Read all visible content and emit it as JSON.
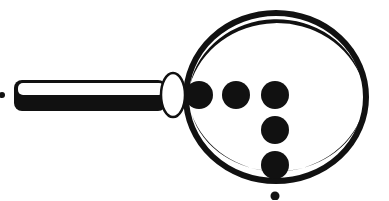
{
  "figure": {
    "colors": {
      "ink": "#111111",
      "paper": "#ffffff"
    },
    "lens": {
      "cx": 275,
      "cy": 97,
      "rx": 92,
      "ry": 85,
      "stroke_width": 7
    },
    "handle": {
      "x": 14,
      "y": 80,
      "width": 150,
      "height": 31
    },
    "ferrule": {
      "cx": 173,
      "cy": 95,
      "rx": 13,
      "ry": 22
    },
    "dots": [
      {
        "cx": 199,
        "cy": 95,
        "r": 14
      },
      {
        "cx": 236,
        "cy": 95,
        "r": 14
      },
      {
        "cx": 275,
        "cy": 95,
        "r": 14
      },
      {
        "cx": 275,
        "cy": 130,
        "r": 14
      },
      {
        "cx": 275,
        "cy": 165,
        "r": 14
      }
    ],
    "small_dots": [
      {
        "cx": 2,
        "cy": 95,
        "r": 3
      },
      {
        "cx": 275,
        "cy": 195,
        "r": 5
      }
    ]
  }
}
